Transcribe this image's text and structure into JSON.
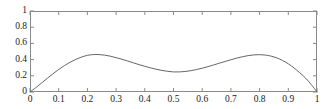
{
  "figure": {
    "title": "Deltat",
    "background_color": "#ffffff",
    "axis_color": "#8a8a8a",
    "curve_color": "#555555",
    "text_color": "#1a1a1a"
  },
  "chart_data": {
    "type": "line",
    "title": "Deltat",
    "xlabel": "",
    "ylabel": "",
    "xlim": [
      0,
      1
    ],
    "ylim": [
      0,
      1
    ],
    "grid": false,
    "legend": null,
    "xticks": [
      0,
      0.1,
      0.2,
      0.3,
      0.4,
      0.5,
      0.6,
      0.7,
      0.8,
      0.9,
      1
    ],
    "xtick_labels": [
      "0",
      "0.1",
      "0.2",
      "0.3",
      "0.4",
      "0.5",
      "0.6",
      "0.7",
      "0.8",
      "0.9",
      "1"
    ],
    "yticks": [
      0,
      0.2,
      0.4,
      0.6,
      0.8,
      1
    ],
    "ytick_labels": [
      "0",
      "0.2",
      "0.4",
      "0.6",
      "0.8",
      "1"
    ],
    "tick_direction": "in",
    "series": [
      {
        "name": "curve",
        "color": "#555555",
        "line_width": 0.9,
        "x": [
          0.0,
          0.02,
          0.04,
          0.06,
          0.08,
          0.1,
          0.12,
          0.14,
          0.16,
          0.18,
          0.2,
          0.22,
          0.24,
          0.26,
          0.28,
          0.3,
          0.32,
          0.34,
          0.36,
          0.38,
          0.4,
          0.42,
          0.44,
          0.46,
          0.48,
          0.5,
          0.52,
          0.54,
          0.56,
          0.58,
          0.6,
          0.62,
          0.64,
          0.66,
          0.68,
          0.7,
          0.72,
          0.74,
          0.76,
          0.78,
          0.8,
          0.82,
          0.84,
          0.86,
          0.88,
          0.9,
          0.92,
          0.94,
          0.96,
          0.98,
          1.0
        ],
        "y": [
          0.0,
          0.053,
          0.11,
          0.168,
          0.225,
          0.278,
          0.326,
          0.368,
          0.403,
          0.432,
          0.452,
          0.462,
          0.462,
          0.455,
          0.442,
          0.424,
          0.404,
          0.383,
          0.36,
          0.338,
          0.317,
          0.298,
          0.281,
          0.266,
          0.255,
          0.248,
          0.248,
          0.253,
          0.263,
          0.277,
          0.294,
          0.313,
          0.334,
          0.356,
          0.377,
          0.398,
          0.418,
          0.435,
          0.449,
          0.458,
          0.461,
          0.456,
          0.443,
          0.421,
          0.389,
          0.348,
          0.297,
          0.238,
          0.172,
          0.092,
          0.0
        ]
      }
    ],
    "annotations": []
  }
}
